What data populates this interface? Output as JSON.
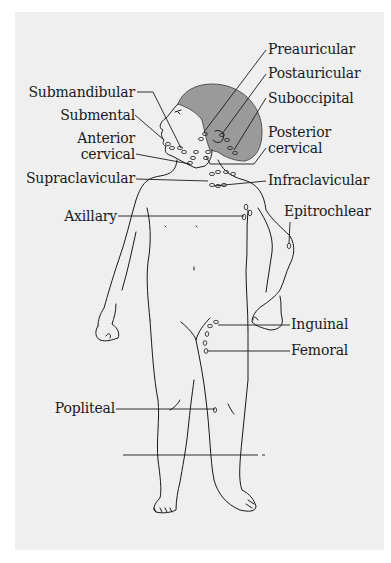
{
  "figure": {
    "colors": {
      "background": "#efefef",
      "hair": "#9a9a9a",
      "line": "#1a1a1a",
      "text": "#1a1a1a"
    }
  },
  "labels": {
    "left": [
      {
        "id": "submandibular",
        "text": "Submandibular"
      },
      {
        "id": "submental",
        "text": "Submental"
      },
      {
        "id": "anterior_cervical_1",
        "text": "Anterior"
      },
      {
        "id": "anterior_cervical_2",
        "text": "cervical"
      },
      {
        "id": "supraclavicular",
        "text": "Supraclavicular"
      },
      {
        "id": "axillary",
        "text": "Axillary"
      },
      {
        "id": "popliteal",
        "text": "Popliteal"
      }
    ],
    "right": [
      {
        "id": "preauricular",
        "text": "Preauricular"
      },
      {
        "id": "postauricular",
        "text": "Postauricular"
      },
      {
        "id": "suboccipital",
        "text": "Suboccipital"
      },
      {
        "id": "posterior_cervical_1",
        "text": "Posterior"
      },
      {
        "id": "posterior_cervical_2",
        "text": "cervical"
      },
      {
        "id": "infraclavicular",
        "text": "Infraclavicular"
      },
      {
        "id": "epitrochlear",
        "text": "Epitrochlear"
      },
      {
        "id": "inguinal",
        "text": "Inguinal"
      },
      {
        "id": "femoral",
        "text": "Femoral"
      }
    ]
  }
}
